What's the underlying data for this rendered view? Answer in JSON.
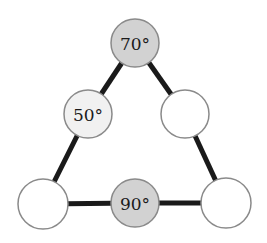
{
  "diagram": {
    "type": "triangle-of-circles",
    "colors": {
      "background": "#ffffff",
      "edge": "#1a1a1a",
      "outline": "#8a8a8a",
      "filled_gray": "#d2d2d2",
      "light_gray": "#f1f1f1",
      "empty": "#ffffff"
    },
    "nodes": [
      {
        "id": "top",
        "cx": 135,
        "cy": 43,
        "r": 24,
        "fill": "#d2d2d2",
        "label": "70°"
      },
      {
        "id": "left-mid",
        "cx": 88,
        "cy": 114,
        "r": 24,
        "fill": "#f1f1f1",
        "label": "50°"
      },
      {
        "id": "right-mid",
        "cx": 185,
        "cy": 114,
        "r": 24,
        "fill": "#ffffff",
        "label": ""
      },
      {
        "id": "bottom-left",
        "cx": 43,
        "cy": 204,
        "r": 25,
        "fill": "#ffffff",
        "label": ""
      },
      {
        "id": "bottom-mid",
        "cx": 135,
        "cy": 203,
        "r": 24,
        "fill": "#d2d2d2",
        "label": "90°"
      },
      {
        "id": "bottom-right",
        "cx": 226,
        "cy": 203,
        "r": 25,
        "fill": "#ffffff",
        "label": ""
      }
    ],
    "edges": [
      [
        "top",
        "left-mid"
      ],
      [
        "left-mid",
        "bottom-left"
      ],
      [
        "top",
        "right-mid"
      ],
      [
        "right-mid",
        "bottom-right"
      ],
      [
        "bottom-left",
        "bottom-mid"
      ],
      [
        "bottom-mid",
        "bottom-right"
      ]
    ]
  },
  "labels": {
    "top": "70°",
    "left_mid": "50°",
    "bottom_mid": "90°"
  }
}
